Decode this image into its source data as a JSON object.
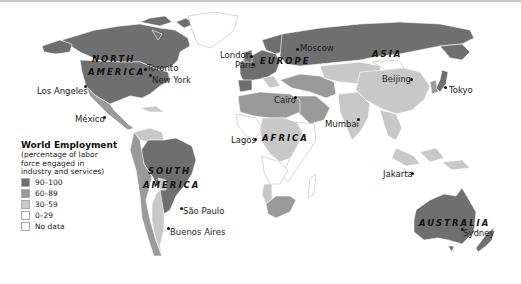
{
  "legend": {
    "title": "World Employment",
    "subtitle": "(percentage of labor force engaged in industry and services)",
    "items": [
      {
        "label": "90–100",
        "color": "#6f6f6f"
      },
      {
        "label": "60–89",
        "color": "#9a9a9a"
      },
      {
        "label": "30–59",
        "color": "#c8c8c8"
      },
      {
        "label": "0–29",
        "color": "#ffffff"
      },
      {
        "label": "No data",
        "color": "#ffffff"
      }
    ]
  },
  "regions": {
    "north_america": [
      "NORTH",
      "AMERICA"
    ],
    "south_america": [
      "SOUTH",
      "AMERICA"
    ],
    "europe": "EUROPE",
    "asia": "ASIA",
    "africa": "AFRICA",
    "australia": "AUSTRALIA"
  },
  "cities": {
    "toronto": "Toronto",
    "new_york": "New York",
    "los_angeles": "Los Angeles",
    "mexico": "México",
    "sao_paulo": "São Paulo",
    "buenos_aires": "Buenos Aires",
    "london": "London",
    "paris": "Paris",
    "moscow": "Moscow",
    "cairo": "Cairo",
    "lagos": "Lagos",
    "mumbai": "Mumbai",
    "beijing": "Beijing",
    "tokyo": "Tokyo",
    "jakarta": "Jakarta",
    "sydney": "Sydney"
  }
}
